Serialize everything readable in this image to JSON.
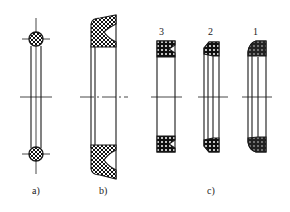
{
  "figure": {
    "type": "technical drawing of seals (cross sections)",
    "panels": [
      {
        "id": "a",
        "label": "a)",
        "description": "O-ring seal"
      },
      {
        "id": "b",
        "label": "b)",
        "description": "lip (U-cup) seal"
      },
      {
        "id": "c",
        "label": "c)",
        "description": "three lip seal variants",
        "parts": [
          {
            "number": "3"
          },
          {
            "number": "2"
          },
          {
            "number": "1"
          }
        ]
      }
    ],
    "colors": {
      "line": "#1a1a1a",
      "background": "#ffffff"
    }
  }
}
